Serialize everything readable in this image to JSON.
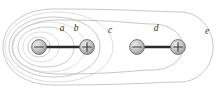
{
  "figure": {
    "background_color": "#ffffff",
    "width": 220,
    "height": 90
  },
  "palette": {
    "contour_stroke": "#b9b9b9",
    "contour_stroke_faint": "#cfcfcf",
    "dipole_bar": "#2b2b2b",
    "charge_fill_start": "#e2e2e2",
    "charge_fill_end": "#9b9b9b",
    "charge_outline": "#6a6a6a",
    "charge_sign": "#3a3a3a",
    "label_color": "#2e2e2e"
  },
  "labels": [
    {
      "id": "a",
      "text": "a",
      "x": 62,
      "y": 31
    },
    {
      "id": "b",
      "text": "b",
      "x": 76,
      "y": 31
    },
    {
      "id": "c",
      "text": "c",
      "x": 110,
      "y": 33
    },
    {
      "id": "d",
      "text": "d",
      "x": 156,
      "y": 31
    },
    {
      "id": "e",
      "text": "e",
      "x": 207,
      "y": 34
    }
  ],
  "charges": [
    {
      "id": "charge-1",
      "sign": "minus",
      "symbol": "−",
      "cx": 39,
      "cy": 47,
      "r": 7.4,
      "group": "left-dipole"
    },
    {
      "id": "charge-2",
      "sign": "plus",
      "symbol": "+",
      "cx": 87,
      "cy": 47,
      "r": 7.4,
      "group": "left-dipole"
    },
    {
      "id": "charge-3",
      "sign": "minus",
      "symbol": "−",
      "cx": 137,
      "cy": 47,
      "r": 7.4,
      "group": "right-dipole"
    },
    {
      "id": "charge-4",
      "sign": "plus",
      "symbol": "+",
      "cx": 178,
      "cy": 47,
      "r": 7.4,
      "group": "right-dipole"
    }
  ],
  "dipole_bars": [
    {
      "id": "bar-left",
      "x1": 39,
      "y1": 47,
      "x2": 87,
      "y2": 47
    },
    {
      "id": "bar-right",
      "x1": 137,
      "y1": 47,
      "x2": 178,
      "y2": 47
    }
  ],
  "contours": [
    {
      "id": "contour-a",
      "label": "a",
      "d": "M 39 37 C 33 37 28 41 28 47 C 28 53 33 57 39 57 C 45 57 50 53 50 47 C 50 41 45 37 39 37 Z"
    },
    {
      "id": "contour-a2",
      "label": "a",
      "d": "M 41 32 C 31 32 23 38 23 47 C 23 56 31 62 41 62 C 51 62 59 56 59 47 C 59 38 51 32 41 32 Z"
    },
    {
      "id": "contour-b",
      "label": "b",
      "d": "M 46 27 C 31 27 18 35 18 47 C 18 59 31 67 46 67 C 63 67 74 59 74 47 C 74 35 63 27 46 27 Z"
    },
    {
      "id": "contour-b2",
      "label": "b",
      "d": "M 49 22 C 29 22 13 33 13 47 C 13 61 29 72 49 72 C 71 72 85 61 85 47 C 85 33 71 22 49 22 Z"
    },
    {
      "id": "contour-c",
      "label": "c",
      "d": "M 53 17 C 28 17 9 30 9 47 C 9 64 28 77 53 77 C 82 77 100 64 100 47 C 100 30 82 17 53 17 Z"
    },
    {
      "id": "contour-c2",
      "label": "c",
      "d": "M 56 12 C 26 12 5 28 5 47 C 5 66 26 82 56 82 C 92 82 113 65 113 47 C 113 29 92 12 56 12 Z"
    },
    {
      "id": "contour-d",
      "label": "d",
      "d": "M 58 20 C 30 20 12 32 12 47 C 12 62 30 74 58 74 C 120 74 136 70 152 70 C 170 70 183 60 183 47 C 183 34 170 24 152 24 C 136 24 120 20 58 20 Z"
    },
    {
      "id": "contour-e",
      "label": "e",
      "d": "M 54 9 C 22 9 3 26 3 47 C 3 68 22 85 54 85 C 130 85 160 82 180 82 C 199 82 213 66 213 47 C 213 28 199 12 180 12 C 160 12 130 9 54 9 Z"
    }
  ]
}
